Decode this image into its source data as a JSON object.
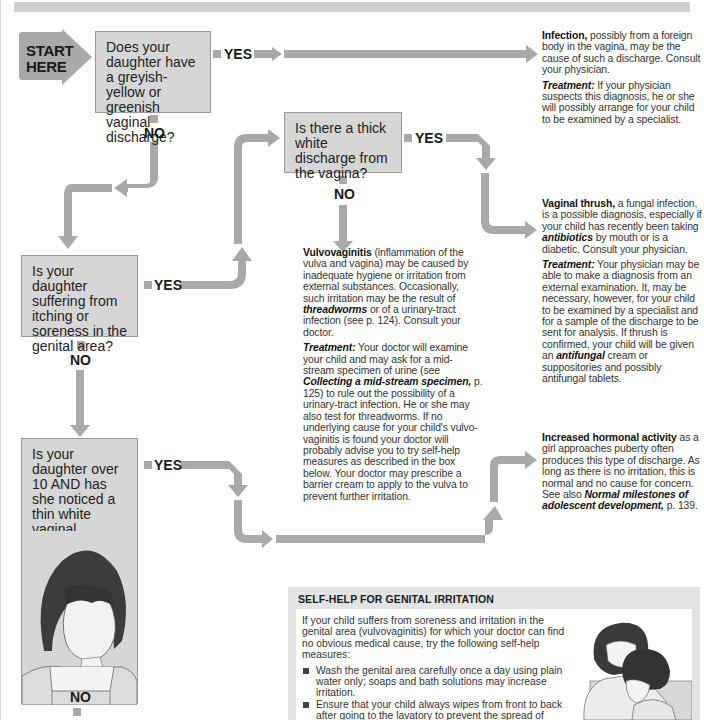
{
  "start": {
    "label_line1": "START",
    "label_line2": "HERE"
  },
  "questions": [
    {
      "id": "q1",
      "text": "Does your daughter have a greyish-yellow or greenish vaginal discharge?"
    },
    {
      "id": "q2",
      "text": "Is there a thick white discharge from the vagina?"
    },
    {
      "id": "q3",
      "text": "Is your daughter suffering from itching or soreness in the genital area?"
    },
    {
      "id": "q4",
      "text": "Is your daughter over 10 AND has she noticed a thin white vaginal discharge?"
    }
  ],
  "labels": {
    "yes": "YES",
    "no": "NO"
  },
  "outcomes": {
    "infection": {
      "title": "Infection,",
      "body": " possibly from a foreign body in the vagina, may be the cause of such a discharge. Consult your physician.",
      "treatment_label": "Treatment:",
      "treatment": " If your physician suspects this diagnosis, he or she will possibly arrange for your child to be examined by a specialist."
    },
    "thrush": {
      "title": "Vaginal thrush,",
      "body_1": " a fungal infection, is a possible diagnosis, especially if your child has recently been taking ",
      "body_em": "antibiotics",
      "body_2": " by mouth or is a diabetic. Consult your physician.",
      "treatment_label": "Treatment:",
      "treatment_1": " Your physician may be able to make a diagnosis from an external examination. It, may be necessary, however, for your child to be examined by a specialist and for a sample of the discharge to be sent for analysis. If thrush is confirmed, your child will be given an ",
      "treatment_em": "antifungal",
      "treatment_2": " cream or suppositories and possibly antifungal tablets."
    },
    "vulvovaginitis": {
      "title": "Vulvovaginitis",
      "body_1": " (inflammation of the vulva and vagina) may be caused by inadequate hygiene or irritation from external substances. Occasionally, such irritation may be the result of ",
      "body_em": "threadworms",
      "body_2": " or of a urinary-tract infection (see p. 124). Consult your doctor.",
      "treatment_label": "Treatment:",
      "treatment_1": " Your doctor will examine your child and may ask for a mid-stream specimen of urine (see ",
      "treatment_em": "Collecting a mid-stream specimen,",
      "treatment_2": " p. 125) to rule out the possibility of a urinary-tract infection. He or she may also test for threadworms. If no underlying cause for your child's vulvo-vaginitis is found your doctor will probably advise you to try self-help measures as described in the box below. Your doctor may prescribe a barrier cream to apply to the vulva to prevent further irritation."
    },
    "hormonal": {
      "title": "Increased hormonal activity",
      "body_1": " as a girl approaches puberty often produces this type of discharge. As long as there is no irritation, this is normal and no cause for concern. See also ",
      "body_em": "Normal milestones of adolescent development,",
      "body_2": " p. 139."
    }
  },
  "selfhelp": {
    "title": "SELF-HELP FOR GENITAL IRRITATION",
    "intro": "If your child suffers from soreness and irritation in the genital area (vulvovaginitis) for which your doctor can find no obvious medical cause, try the following self-help measures:",
    "items": [
      "Wash the genital area carefully once a day using plain water only; soaps and bath solutions may increase irritation.",
      "Ensure that your child always wipes from front to back after going to the lavatory to prevent the spread of germs from the bowel to the vagina and"
    ]
  },
  "illustrations": {
    "girl": "girl-looking-down-illustration",
    "mother_child": "mother-hugging-child-illustration"
  },
  "colors": {
    "arrow": "#a9a9a9",
    "box_fill": "#d6d6d6",
    "box_border": "#9a9a9a",
    "start_fill": "#8f8f8f",
    "panel": "#e3e3e3",
    "text": "#222222"
  }
}
